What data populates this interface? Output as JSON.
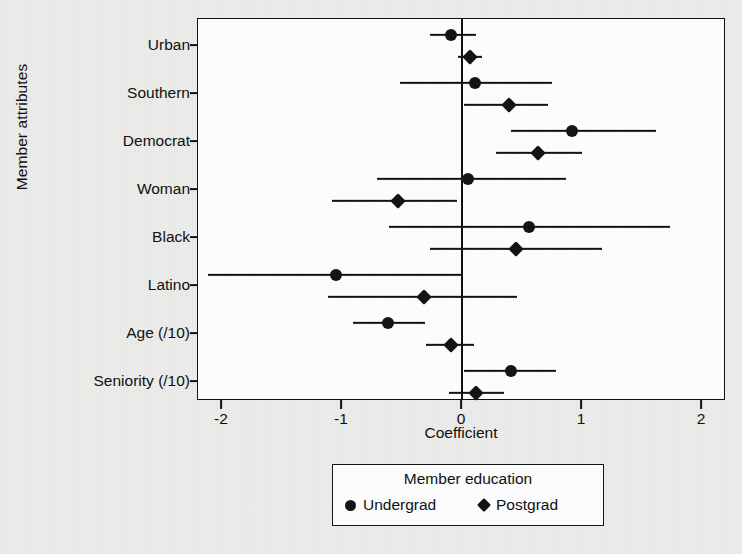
{
  "chart_data": {
    "type": "scatter",
    "subtype": "dot-and-whisker coefficient plot",
    "title": "",
    "xlabel": "Coefficient",
    "ylabel": "Member attributes",
    "xlim": [
      -2.2,
      2.2
    ],
    "xticks": [
      -2,
      -1,
      0,
      1,
      2
    ],
    "xtick_labels": [
      "-2",
      "-1",
      "0",
      "1",
      "2"
    ],
    "grid": false,
    "reference_line_x": 0,
    "categories": [
      "Urban",
      "Southern",
      "Democrat",
      "Woman",
      "Black",
      "Latino",
      "Age (/10)",
      "Seniority (/10)"
    ],
    "legend": {
      "title": "Member education",
      "position": "below-plot",
      "entries": [
        {
          "label": "Undergrad",
          "marker": "circle"
        },
        {
          "label": "Postgrad",
          "marker": "diamond"
        }
      ]
    },
    "series": [
      {
        "name": "Undergrad",
        "marker": "circle",
        "values": [
          -0.09,
          0.11,
          0.92,
          0.05,
          0.56,
          -1.05,
          -0.62,
          0.41
        ],
        "ci_low": [
          -0.27,
          -0.52,
          0.41,
          -0.71,
          -0.61,
          -2.12,
          -0.91,
          0.02
        ],
        "ci_high": [
          0.12,
          0.75,
          1.62,
          0.87,
          1.73,
          0.0,
          -0.31,
          0.78
        ]
      },
      {
        "name": "Postgrad",
        "marker": "diamond",
        "values": [
          0.07,
          0.39,
          0.63,
          -0.53,
          0.45,
          -0.32,
          -0.09,
          0.12
        ],
        "ci_low": [
          -0.03,
          0.02,
          0.28,
          -1.08,
          -0.27,
          -1.12,
          -0.3,
          -0.11
        ],
        "ci_high": [
          0.17,
          0.72,
          1.0,
          -0.04,
          1.17,
          0.46,
          0.1,
          0.35
        ]
      }
    ]
  },
  "axes": {
    "x_title": "Coefficient",
    "y_title": "Member attributes"
  }
}
